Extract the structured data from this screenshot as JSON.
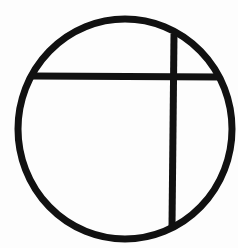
{
  "symbol": {
    "name": "circle-with-cross-chords",
    "stroke_color": "#111111",
    "background_color": "#fdfdfd",
    "circle": {
      "cx": 125,
      "cy": 129,
      "rx": 107,
      "ry": 110,
      "stroke_width": 7
    },
    "horizontal_chord": {
      "x1": 33,
      "y1": 76,
      "x2": 220,
      "y2": 77,
      "stroke_width": 7
    },
    "vertical_chord": {
      "x1": 174,
      "y1": 34,
      "x2": 172,
      "y2": 226,
      "stroke_width": 7
    }
  }
}
